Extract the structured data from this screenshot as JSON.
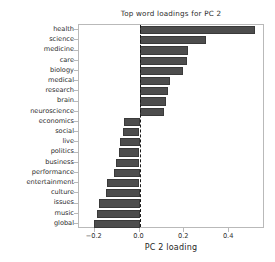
{
  "chart_data": {
    "type": "bar",
    "orientation": "horizontal",
    "title": "Top word loadings for PC 2",
    "xlabel": "PC 2 loading",
    "ylabel": "",
    "grid": false,
    "legend": null,
    "xlim": [
      -0.27,
      0.56
    ],
    "xticks": [
      -0.2,
      0.0,
      0.2,
      0.4
    ],
    "xticklabels": [
      "−0.2",
      "0.0",
      "0.2",
      "0.4"
    ],
    "zero_reference_line": 0.0,
    "bar_color": "#4d4d4d",
    "bar_edge_color": "#3a3a3a",
    "categories": [
      "health",
      "science",
      "medicine",
      "care",
      "biology",
      "medical",
      "research",
      "brain",
      "neuroscience",
      "economics",
      "social",
      "live",
      "politics",
      "business",
      "performance",
      "entertainment",
      "culture",
      "issues",
      "music",
      "global"
    ],
    "values": [
      0.515,
      0.295,
      0.215,
      0.212,
      0.195,
      0.138,
      0.128,
      0.12,
      0.108,
      -0.068,
      -0.072,
      -0.088,
      -0.09,
      -0.105,
      -0.112,
      -0.143,
      -0.15,
      -0.182,
      -0.19,
      -0.205
    ]
  }
}
